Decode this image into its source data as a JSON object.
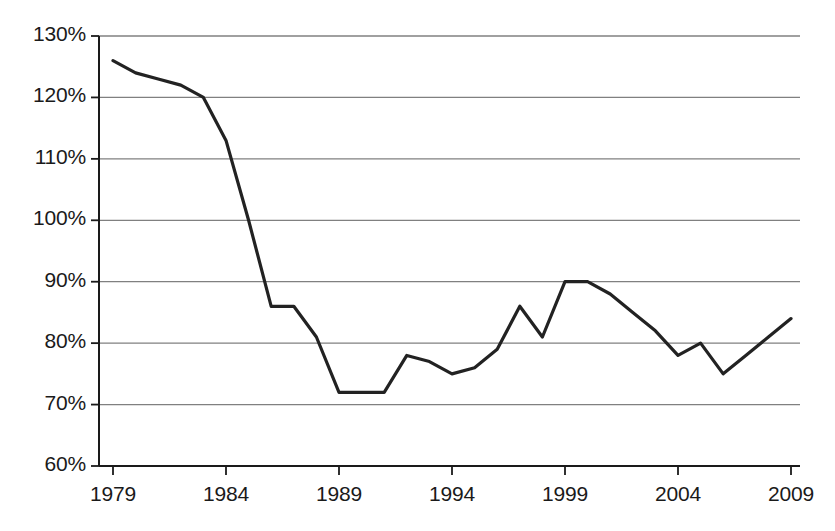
{
  "chart_data": {
    "type": "line",
    "title": "",
    "subtitle": "",
    "xlabel": "",
    "ylabel": "",
    "xlim": [
      1979,
      2009
    ],
    "ylim": [
      60,
      130
    ],
    "grid": true,
    "legend": null,
    "y_tick_labels": [
      "130%",
      "120%",
      "110%",
      "100%",
      "90%",
      "80%",
      "70%",
      "60%"
    ],
    "y_ticks": [
      130,
      120,
      110,
      100,
      90,
      80,
      70,
      60
    ],
    "x_tick_labels": [
      "1979",
      "1984",
      "1989",
      "1994",
      "1999",
      "2004",
      "2009"
    ],
    "x_ticks": [
      1979,
      1984,
      1989,
      1994,
      1999,
      2004,
      2009
    ],
    "x": [
      1979,
      1980,
      1981,
      1982,
      1983,
      1984,
      1985,
      1986,
      1987,
      1988,
      1989,
      1990,
      1991,
      1992,
      1993,
      1994,
      1995,
      1996,
      1997,
      1998,
      1999,
      2000,
      2001,
      2002,
      2003,
      2004,
      2005,
      2006,
      2007,
      2008,
      2009
    ],
    "values": [
      126,
      124,
      123,
      122,
      120,
      113,
      100,
      86,
      86,
      81,
      72,
      72,
      72,
      78,
      77,
      75,
      76,
      79,
      86,
      81,
      90,
      90,
      88,
      85,
      82,
      78,
      80,
      75,
      78,
      81,
      84
    ],
    "series": [
      {
        "name": "",
        "color": "#222222",
        "values": [
          126,
          124,
          123,
          122,
          120,
          113,
          100,
          86,
          86,
          81,
          72,
          72,
          72,
          78,
          77,
          75,
          76,
          79,
          86,
          81,
          90,
          90,
          88,
          85,
          82,
          78,
          80,
          75,
          78,
          81,
          84
        ]
      }
    ],
    "colors": {
      "line": "#222222",
      "grid": "#808080",
      "axis": "#1a1a1a",
      "background": "#ffffff",
      "text": "#1a1a1a"
    }
  }
}
